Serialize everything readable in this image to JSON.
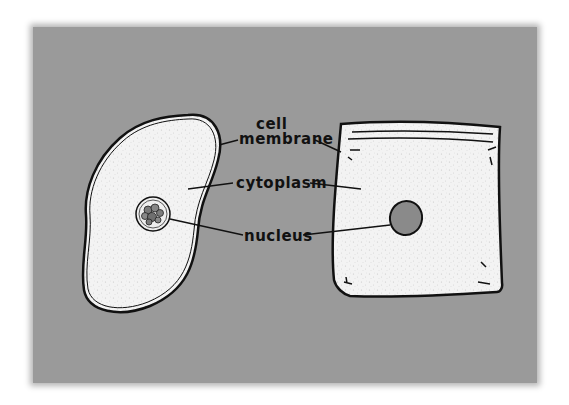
{
  "figure": {
    "background_color": "#9a9a9a",
    "fill_color": "#f4f4f4",
    "outline_color": "#111111",
    "nucleus_color": "#8a8a8a"
  },
  "labels": {
    "cell_line1": "cell",
    "cell_line2": "membrane",
    "cytoplasm": "cytoplasm",
    "nucleus": "nucleus"
  },
  "left_object": {
    "name": "animal cell",
    "parts": [
      "cell membrane",
      "cytoplasm",
      "nucleus"
    ]
  },
  "right_object": {
    "name": "zip-top bag model",
    "parts": [
      "bag (cell membrane)",
      "filling (cytoplasm)",
      "oval (nucleus)"
    ]
  }
}
